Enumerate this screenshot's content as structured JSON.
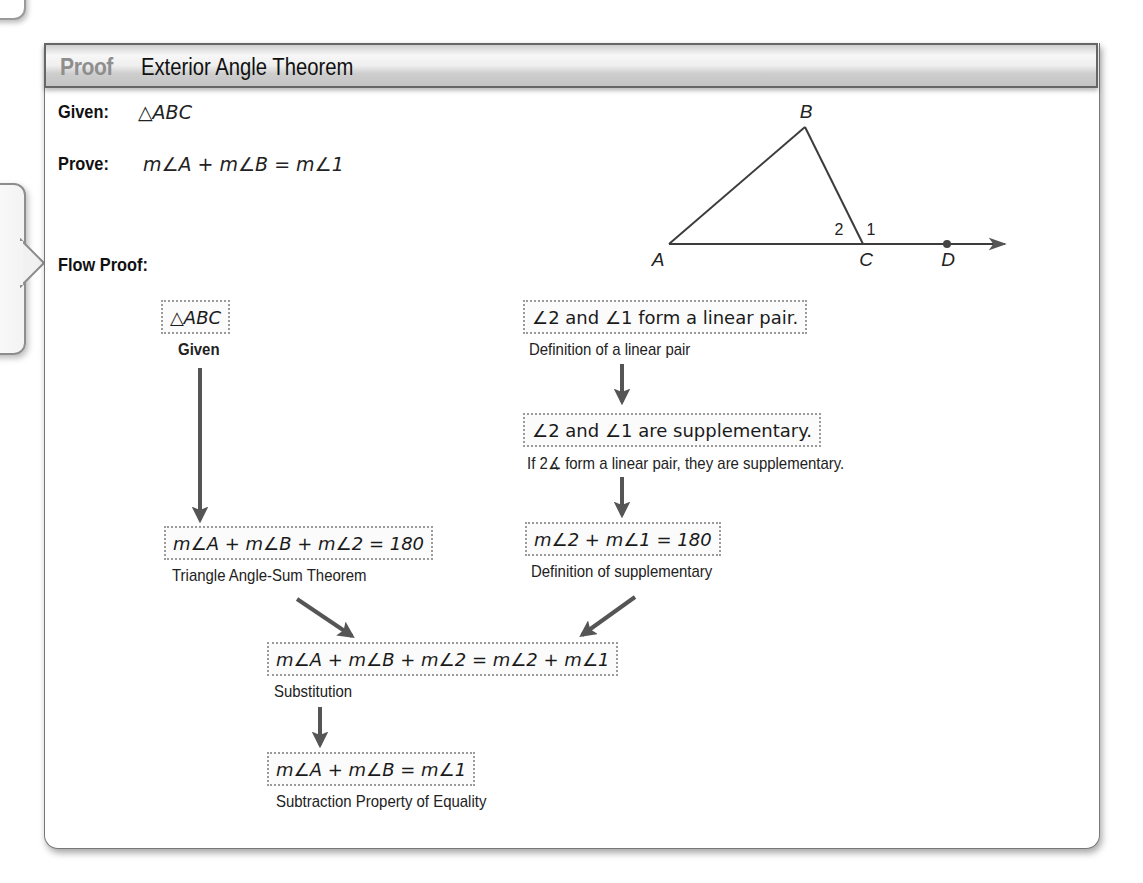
{
  "header": {
    "tag": "Proof",
    "title": "Exterior Angle Theorem"
  },
  "given": {
    "label": "Given:",
    "statement": "△ABC"
  },
  "prove": {
    "label": "Prove:",
    "statement": "m∠A + m∠B = m∠1"
  },
  "flow_proof_label": "Flow Proof:",
  "diagram": {
    "points": {
      "A": "A",
      "B": "B",
      "C": "C",
      "D": "D"
    },
    "angle_labels": {
      "angle2": "2",
      "angle1": "1"
    }
  },
  "steps": [
    {
      "statement": "△ABC",
      "reason": "Given"
    },
    {
      "statement": "∠2 and ∠1 form a linear pair.",
      "reason": "Definition of a linear pair"
    },
    {
      "statement": "∠2 and ∠1 are supplementary.",
      "reason": "If 2∡ form a linear pair, they are supplementary."
    },
    {
      "statement": "m∠A + m∠B + m∠2 = 180",
      "reason": "Triangle Angle-Sum Theorem"
    },
    {
      "statement": "m∠2 + m∠1 = 180",
      "reason": "Definition of supplementary"
    },
    {
      "statement": "m∠A + m∠B + m∠2 = m∠2 + m∠1",
      "reason": "Substitution"
    },
    {
      "statement": "m∠A + m∠B = m∠1",
      "reason": "Subtraction Property of Equality"
    }
  ],
  "colors": {
    "arrow": "#555555",
    "proof_tag": "#8e8e8e",
    "box_border": "#9b9b9b"
  }
}
